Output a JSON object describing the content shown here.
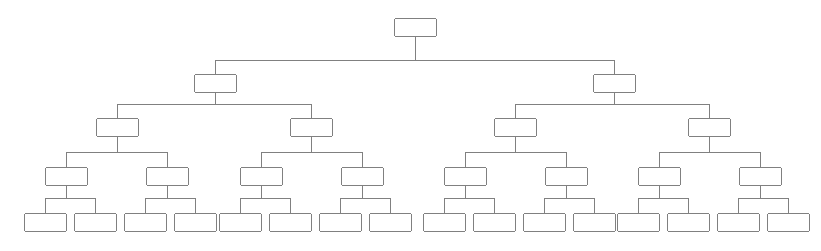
{
  "diagram": {
    "title": "",
    "type": "tree",
    "orientation": "top-down",
    "canvas": {
      "width": 821,
      "height": 251,
      "background": "#ffffff"
    },
    "style": {
      "node_fill": "#ffffff",
      "node_stroke": "#808080",
      "node_stroke_width": 1,
      "node_corner_radius": 2,
      "edge_stroke": "#808080",
      "edge_stroke_width": 1,
      "node_width": 42,
      "node_height": 18
    },
    "levels": [
      {
        "index": 0,
        "name": "root",
        "y": 18,
        "node_count": 1
      },
      {
        "index": 1,
        "name": "level-1",
        "y": 74,
        "node_count": 2
      },
      {
        "index": 2,
        "name": "level-2",
        "y": 118,
        "node_count": 4
      },
      {
        "index": 3,
        "name": "level-3",
        "y": 167,
        "node_count": 8
      },
      {
        "index": 4,
        "name": "leaf-level",
        "y": 213,
        "node_count": 16
      }
    ],
    "connector_rows": [
      {
        "from_level": 0,
        "to_level": 1,
        "y": 60
      },
      {
        "from_level": 1,
        "to_level": 2,
        "y": 104
      },
      {
        "from_level": 2,
        "to_level": 3,
        "y": 152
      },
      {
        "from_level": 3,
        "to_level": 4,
        "y": 198
      }
    ],
    "nodes": [
      {
        "id": "n0",
        "level": 0,
        "x": 394,
        "y": 18,
        "w": 42,
        "h": 18,
        "label": "",
        "parent": null
      },
      {
        "id": "n1",
        "level": 1,
        "x": 194,
        "y": 74,
        "w": 42,
        "h": 18,
        "label": "",
        "parent": "n0"
      },
      {
        "id": "n2",
        "level": 1,
        "x": 593,
        "y": 74,
        "w": 42,
        "h": 18,
        "label": "",
        "parent": "n0"
      },
      {
        "id": "n1-1",
        "level": 2,
        "x": 96,
        "y": 118,
        "w": 42,
        "h": 18,
        "label": "",
        "parent": "n1"
      },
      {
        "id": "n1-2",
        "level": 2,
        "x": 290,
        "y": 118,
        "w": 42,
        "h": 18,
        "label": "",
        "parent": "n1"
      },
      {
        "id": "n2-1",
        "level": 2,
        "x": 494,
        "y": 118,
        "w": 42,
        "h": 18,
        "label": "",
        "parent": "n2"
      },
      {
        "id": "n2-2",
        "level": 2,
        "x": 688,
        "y": 118,
        "w": 42,
        "h": 18,
        "label": "",
        "parent": "n2"
      },
      {
        "id": "n1-1-1",
        "level": 3,
        "x": 45,
        "y": 167,
        "w": 42,
        "h": 18,
        "label": "",
        "parent": "n1-1"
      },
      {
        "id": "n1-1-2",
        "level": 3,
        "x": 146,
        "y": 167,
        "w": 42,
        "h": 18,
        "label": "",
        "parent": "n1-1"
      },
      {
        "id": "n1-2-1",
        "level": 3,
        "x": 240,
        "y": 167,
        "w": 42,
        "h": 18,
        "label": "",
        "parent": "n1-2"
      },
      {
        "id": "n1-2-2",
        "level": 3,
        "x": 341,
        "y": 167,
        "w": 42,
        "h": 18,
        "label": "",
        "parent": "n1-2"
      },
      {
        "id": "n2-1-1",
        "level": 3,
        "x": 444,
        "y": 167,
        "w": 42,
        "h": 18,
        "label": "",
        "parent": "n2-1"
      },
      {
        "id": "n2-1-2",
        "level": 3,
        "x": 545,
        "y": 167,
        "w": 42,
        "h": 18,
        "label": "",
        "parent": "n2-1"
      },
      {
        "id": "n2-2-1",
        "level": 3,
        "x": 638,
        "y": 167,
        "w": 42,
        "h": 18,
        "label": "",
        "parent": "n2-2"
      },
      {
        "id": "n2-2-2",
        "level": 3,
        "x": 739,
        "y": 167,
        "w": 42,
        "h": 18,
        "label": "",
        "parent": "n2-2"
      },
      {
        "id": "l1",
        "level": 4,
        "x": 24,
        "y": 213,
        "w": 42,
        "h": 18,
        "label": "",
        "parent": "n1-1-1"
      },
      {
        "id": "l2",
        "level": 4,
        "x": 74,
        "y": 213,
        "w": 42,
        "h": 18,
        "label": "",
        "parent": "n1-1-1"
      },
      {
        "id": "l3",
        "level": 4,
        "x": 124,
        "y": 213,
        "w": 42,
        "h": 18,
        "label": "",
        "parent": "n1-1-2"
      },
      {
        "id": "l4",
        "level": 4,
        "x": 174,
        "y": 213,
        "w": 42,
        "h": 18,
        "label": "",
        "parent": "n1-1-2"
      },
      {
        "id": "l5",
        "level": 4,
        "x": 219,
        "y": 213,
        "w": 42,
        "h": 18,
        "label": "",
        "parent": "n1-2-1"
      },
      {
        "id": "l6",
        "level": 4,
        "x": 269,
        "y": 213,
        "w": 42,
        "h": 18,
        "label": "",
        "parent": "n1-2-1"
      },
      {
        "id": "l7",
        "level": 4,
        "x": 319,
        "y": 213,
        "w": 42,
        "h": 18,
        "label": "",
        "parent": "n1-2-2"
      },
      {
        "id": "l8",
        "level": 4,
        "x": 369,
        "y": 213,
        "w": 42,
        "h": 18,
        "label": "",
        "parent": "n1-2-2"
      },
      {
        "id": "l9",
        "level": 4,
        "x": 423,
        "y": 213,
        "w": 42,
        "h": 18,
        "label": "",
        "parent": "n2-1-1"
      },
      {
        "id": "l10",
        "level": 4,
        "x": 473,
        "y": 213,
        "w": 42,
        "h": 18,
        "label": "",
        "parent": "n2-1-1"
      },
      {
        "id": "l11",
        "level": 4,
        "x": 523,
        "y": 213,
        "w": 42,
        "h": 18,
        "label": "",
        "parent": "n2-1-2"
      },
      {
        "id": "l12",
        "level": 4,
        "x": 573,
        "y": 213,
        "w": 42,
        "h": 18,
        "label": "",
        "parent": "n2-1-2"
      },
      {
        "id": "l13",
        "level": 4,
        "x": 617,
        "y": 213,
        "w": 42,
        "h": 18,
        "label": "",
        "parent": "n2-2-1"
      },
      {
        "id": "l14",
        "level": 4,
        "x": 667,
        "y": 213,
        "w": 42,
        "h": 18,
        "label": "",
        "parent": "n2-2-1"
      },
      {
        "id": "l15",
        "level": 4,
        "x": 717,
        "y": 213,
        "w": 42,
        "h": 18,
        "label": "",
        "parent": "n2-2-2"
      },
      {
        "id": "l16",
        "level": 4,
        "x": 767,
        "y": 213,
        "w": 42,
        "h": 18,
        "label": "",
        "parent": "n2-2-2"
      }
    ]
  }
}
